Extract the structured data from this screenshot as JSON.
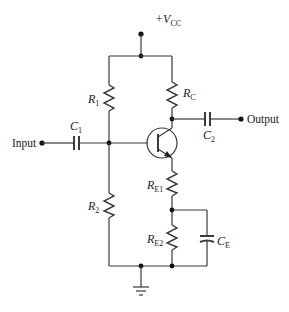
{
  "diagram": {
    "type": "circuit-schematic",
    "supply": {
      "label": "+V",
      "subscript": "CC"
    },
    "terminals": {
      "input": "Input",
      "output": "Output"
    },
    "components": {
      "R1": {
        "label": "R",
        "subscript": "1"
      },
      "R2": {
        "label": "R",
        "subscript": "2"
      },
      "RC": {
        "label": "R",
        "subscript": "C"
      },
      "RE1": {
        "label": "R",
        "subscript": "E1"
      },
      "RE2": {
        "label": "R",
        "subscript": "E2"
      },
      "C1": {
        "label": "C",
        "subscript": "1"
      },
      "C2": {
        "label": "C",
        "subscript": "2"
      },
      "CE": {
        "label": "C",
        "subscript": "E"
      },
      "Q1": {
        "type": "NPN transistor"
      },
      "ground": {
        "type": "ground"
      }
    },
    "colors": {
      "wire": "#3a3a3a",
      "background": "#ffffff"
    }
  }
}
